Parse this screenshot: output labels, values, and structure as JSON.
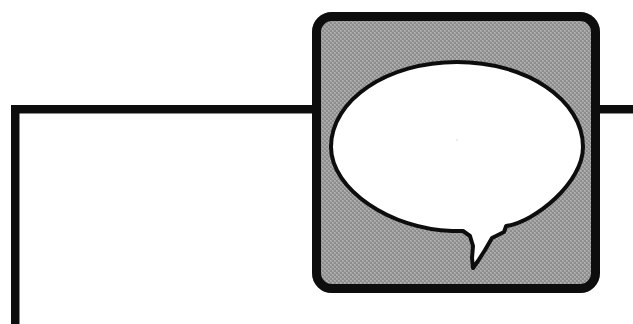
{
  "document": {
    "kind": "scanned-line-art-graphic",
    "title": "Speech bubble icon over partial rectangular frame",
    "width": 633,
    "height": 324,
    "background_color": "#ffffff"
  },
  "colors": {
    "ink": "#111111",
    "paper": "#ffffff",
    "panel_gray": "#9b9b9b",
    "panel_gray_light": "#b4b4b4",
    "panel_gray_dark": "#868686"
  },
  "frame": {
    "name": "partial-rectangle-frame",
    "stroke_color": "#111111",
    "stroke_width": 8,
    "horizontal_rule": {
      "x1": 11,
      "y1": 109,
      "x2": 633,
      "y2": 109
    },
    "vertical_rule": {
      "x1": 15,
      "y1": 105,
      "x2": 15,
      "y2": 324
    }
  },
  "panel": {
    "name": "rounded-square-panel",
    "x": 312,
    "y": 12,
    "width": 288,
    "height": 281,
    "corner_radius": 20,
    "border_width": 9,
    "border_color": "#111111",
    "fill_color": "#9b9b9b"
  },
  "speech_bubble": {
    "name": "speech-bubble",
    "fill_color": "#ffffff",
    "stroke_color": "#111111",
    "stroke_width": 4,
    "ellipse": {
      "cx": 457,
      "cy": 147,
      "rx": 126,
      "ry": 85
    },
    "tail": {
      "description": "downward pointing tail from lower-right of ellipse",
      "tip_x": 473,
      "tip_y": 268
    }
  },
  "labels": {
    "alt_text": "Black and white speech balloon symbol inside a gray rounded square, overlapping a thick black partial border."
  }
}
